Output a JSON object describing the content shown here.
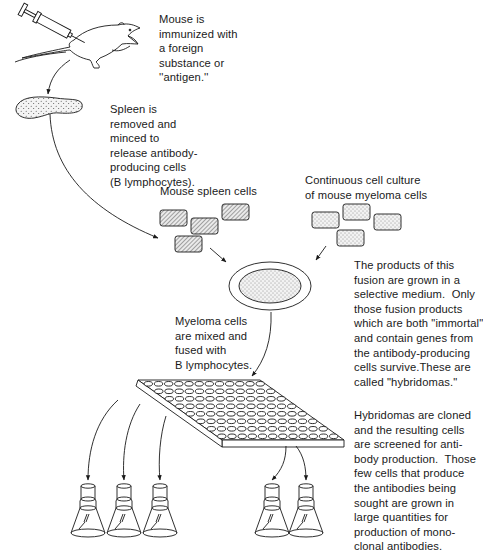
{
  "diagram": {
    "steps": [
      {
        "id": "immunize",
        "lines": [
          "Mouse is",
          "immunized with",
          "a foreign",
          "substance or",
          "''antigen.''"
        ]
      },
      {
        "id": "spleen",
        "lines": [
          "Spleen is",
          "removed and",
          "minced to",
          "release antibody-",
          "producing cells",
          "(B lymphocytes)."
        ]
      },
      {
        "id": "spleen-cells-label",
        "lines": [
          "Mouse spleen cells"
        ]
      },
      {
        "id": "myeloma-label",
        "lines": [
          "Continuous cell culture",
          "of mouse myeloma cells"
        ]
      },
      {
        "id": "fusion",
        "lines": [
          "Myeloma cells",
          "are mixed and",
          "fused with",
          "B lymphocytes."
        ]
      },
      {
        "id": "selection",
        "lines": [
          "The products of this",
          "fusion are grown in a",
          "selective medium.  Only",
          "those fusion products",
          "which are both \"immortal\"",
          "and contain genes from",
          "the antibody-producing",
          "cells survive.These are",
          "called \"hybridomas.\""
        ]
      },
      {
        "id": "cloning",
        "lines": [
          "Hybridomas are cloned",
          "and the resulting cells",
          "are screened for anti-",
          "body production.  Those",
          "few cells that produce",
          "the antibodies being",
          "sought are grown in",
          "large quantities for",
          "production of mono-",
          "clonal antibodies."
        ]
      }
    ],
    "icons": [
      "syringe-icon",
      "mouse-icon",
      "spleen-icon",
      "spleen-cell-icon",
      "myeloma-cell-icon",
      "culture-dish-icon",
      "well-plate-icon",
      "culture-flask-icon"
    ],
    "colors": {
      "ink": "#1a1a1a",
      "background": "#ffffff",
      "fill_light": "#f4f4f4"
    }
  }
}
